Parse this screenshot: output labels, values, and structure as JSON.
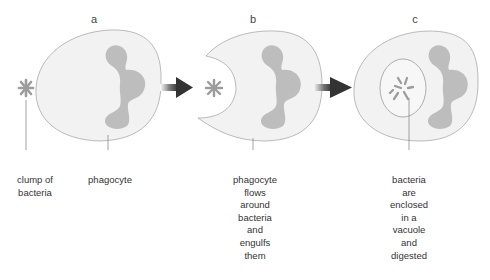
{
  "panels": [
    {
      "letter": "a"
    },
    {
      "letter": "b"
    },
    {
      "letter": "c"
    }
  ],
  "labels": {
    "clump": "clump of\nbacteria",
    "phagocyte": "phagocyte",
    "b_caption": "phagocyte\nflows\naround\nbacteria\nand\nengulfs\nthem",
    "c_caption": "bacteria\nare\nenclosed\nin a\nvacuole\nand\ndigested"
  },
  "colors": {
    "cell_fill": "#f1f1f1",
    "cell_stroke": "#a9a9a9",
    "nucleus": "#b8b8b8",
    "bacteria": "#a0a0a0",
    "arrow": "#333333",
    "leader_line": "#8a8a8a"
  },
  "icons": [
    "arrow-right-icon",
    "bacteria-clump-icon",
    "phagocyte-cell-icon",
    "vacuole-icon"
  ]
}
